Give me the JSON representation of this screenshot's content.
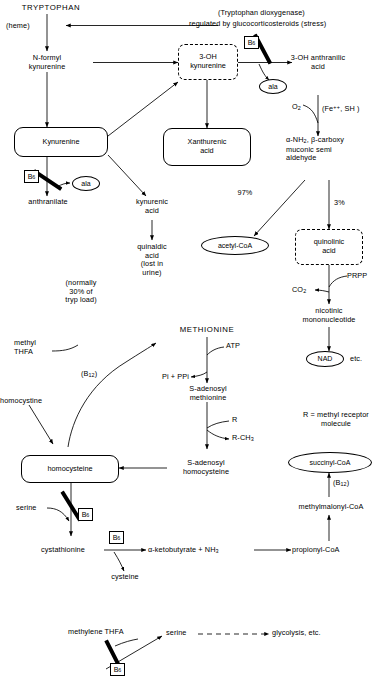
{
  "diagram": {
    "stroke_color": "#000000",
    "background_color": "#ffffff"
  },
  "tryptophan_pathway": {
    "tryptophan": "TRYPTOPHAN",
    "heme": "(heme)",
    "dioxygenase_note_line1": "(Tryptophan dioxygenase)",
    "dioxygenase_note_line2": "regulated by glucocorticosteroids (stress)",
    "n_formyl_kynurenine": "N-formyl\nkynurenine",
    "oh3_kynurenine": "3-OH\nkynurenine",
    "b6_block_1": "B",
    "b6_block_1_sub": "6",
    "ala_1": "ala",
    "oh3_anthranilic_acid": "3-OH anthranilic\nacid",
    "o2": "O",
    "o2_sub": "2",
    "fe_sh": "(Fe",
    "fe_sh_sup": "++",
    "fe_sh_rest": ", SH )",
    "kynurenine": "Kynurenine",
    "xanthurenic_acid": "Xanthurenic\nacid",
    "acms": "α-NH",
    "acms_sub": "2",
    "acms_rest": ", β-carboxy\nmuconic semi\naldehyde",
    "b6_block_2": "B",
    "b6_block_2_sub": "6",
    "ala_2": "ala",
    "anthranilate": "anthranilate",
    "kynurenic_acid": "kynurenic\nacid",
    "quinaldic_acid": "quinaldic\nacid\n(lost in\nurine)",
    "normally_note": "(normally\n30% of\ntryp load)",
    "pct_97": "97%",
    "pct_3": "3%",
    "acetyl_coa": "acetyl-CoA",
    "quinolinic_acid": "quinolinic\nacid",
    "co2": "CO",
    "co2_sub": "2",
    "prpp": "PRPP",
    "nicotinic_mononucleotide": "nicotinic\nmononucleotide",
    "nad": "NAD",
    "etc": "etc."
  },
  "methionine_pathway": {
    "methionine": "METHIONINE",
    "atp": "ATP",
    "pi_ppi": "Pi + PPi",
    "s_adenosyl_methionine": "S-adenosyl\nmethionine",
    "r": "R",
    "r_ch3": "R-CH",
    "r_ch3_sub": "3",
    "r_legend": "R = methyl receptor\nmolecule",
    "s_adenosyl_homocysteine": "S-adenosyl\nhomocysteine",
    "homocysteine": "homocysteine",
    "homocystine": "homocystine",
    "methyl_thfa": "methyl\nTHFA",
    "b12_1": "(B",
    "b12_1_sub": "12",
    "b12_1_rest": ")",
    "serine": "serine",
    "b6_block_3": "B",
    "b6_block_3_sub": "6",
    "cystathionine": "cystathionine",
    "b6_box_4": "B",
    "b6_box_4_sub": "6",
    "cysteine": "cysteine",
    "alpha_ketobutyrate": "α-ketobutyrate + NH",
    "alpha_ketobutyrate_sub": "3",
    "propionyl_coa": "propionyl-CoA",
    "methylmalonyl_coa": "methylmalonyl-CoA",
    "b12_2": "(B",
    "b12_2_sub": "12",
    "b12_2_rest": ")",
    "succinyl_coa": "succinyl-CoA"
  },
  "bottom_panel": {
    "methylene_thfa": "methylene THFA",
    "b6_block_5": "B",
    "b6_block_5_sub": "6",
    "serine": "serine",
    "glycolysis": "glycolysis, etc."
  }
}
